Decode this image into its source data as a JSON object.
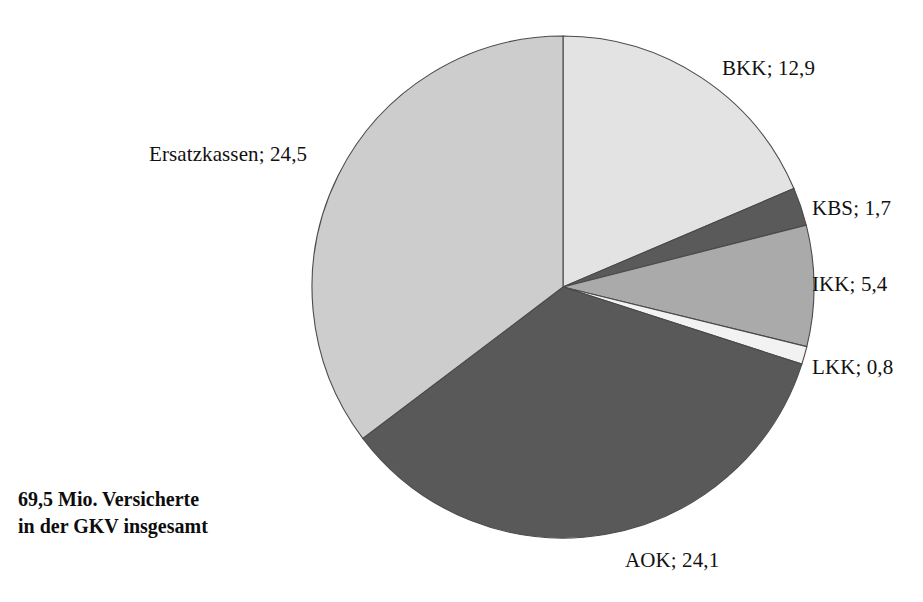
{
  "caption": {
    "line1": "69,5 Mio. Versicherte",
    "line2": "in der GKV insgesamt"
  },
  "labels": {
    "bkk": "BKK; 12,9",
    "kbs": "KBS; 1,7",
    "ikk": "IKK; 5,4",
    "lkk": "LKK; 0,8",
    "aok": "AOK; 24,1",
    "ersatzkassen": "Ersatzkassen; 24,5"
  },
  "chart_data": {
    "type": "pie",
    "title": "",
    "subtitle": "",
    "xlabel": "",
    "ylabel": "",
    "unit": "Mio. Versicherte",
    "total": 69.5,
    "total_label": "69,5 Mio. Versicherte in der GKV insgesamt",
    "start_angle_deg": 0,
    "direction": "clockwise",
    "legend": "none",
    "grid": false,
    "categories": [
      "BKK",
      "KBS",
      "IKK",
      "LKK",
      "AOK",
      "Ersatzkassen"
    ],
    "values": [
      12.9,
      1.7,
      5.4,
      0.8,
      24.1,
      24.5
    ],
    "value_labels": [
      "12,9",
      "1,7",
      "5,4",
      "0,8",
      "24,1",
      "24,5"
    ],
    "colors": [
      "#e3e3e3",
      "#5a5a5a",
      "#aaaaaa",
      "#f2f2f2",
      "#595959",
      "#cdcdcd"
    ],
    "slices": [
      {
        "name": "BKK",
        "value": 12.9,
        "value_label": "12,9",
        "color": "#e3e3e3",
        "label": "BKK; 12,9"
      },
      {
        "name": "KBS",
        "value": 1.7,
        "value_label": "1,7",
        "color": "#5a5a5a",
        "label": "KBS; 1,7"
      },
      {
        "name": "IKK",
        "value": 5.4,
        "value_label": "5,4",
        "color": "#aaaaaa",
        "label": "IKK; 5,4"
      },
      {
        "name": "LKK",
        "value": 0.8,
        "value_label": "0,8",
        "color": "#f2f2f2",
        "label": "LKK; 0,8"
      },
      {
        "name": "AOK",
        "value": 24.1,
        "value_label": "24,1",
        "color": "#595959",
        "label": "AOK; 24,1"
      },
      {
        "name": "Ersatzkassen",
        "value": 24.5,
        "value_label": "24,5",
        "color": "#cdcdcd",
        "label": "Ersatzkassen; 24,5"
      }
    ]
  }
}
